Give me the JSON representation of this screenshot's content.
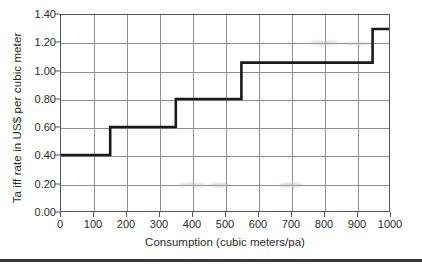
{
  "chart_data": {
    "type": "line",
    "subtype": "step",
    "title": "",
    "xlabel": "Consumption (cubic meters/pa)",
    "ylabel": "Ta iff rate in US$ per cubic meter",
    "xlim": [
      0,
      1000
    ],
    "ylim": [
      0.0,
      1.4
    ],
    "grid": true,
    "legend": null,
    "x_ticks": [
      0,
      100,
      200,
      300,
      400,
      500,
      600,
      700,
      800,
      900,
      1000
    ],
    "x_tick_labels": [
      "0",
      "100",
      "200",
      "300",
      "400",
      "500",
      "600",
      "700",
      "800",
      "900",
      "1000"
    ],
    "y_ticks": [
      0.0,
      0.2,
      0.4,
      0.6,
      0.8,
      1.0,
      1.2,
      1.4
    ],
    "y_tick_labels": [
      "0.00",
      "0.20",
      "0.40",
      "0.60",
      "0.80",
      "1.00",
      "1.20",
      "1.40"
    ],
    "series": [
      {
        "name": "Tariff rate",
        "step_type": "post",
        "color": "#1a1a1a",
        "line_width": 2.6,
        "breakpoints": [
          0,
          150,
          350,
          550,
          950,
          1000
        ],
        "values": [
          0.4,
          0.6,
          0.8,
          1.06,
          1.3
        ],
        "points": [
          {
            "x": 0,
            "y": 0.4
          },
          {
            "x": 150,
            "y": 0.4
          },
          {
            "x": 150,
            "y": 0.6
          },
          {
            "x": 350,
            "y": 0.6
          },
          {
            "x": 350,
            "y": 0.8
          },
          {
            "x": 550,
            "y": 0.8
          },
          {
            "x": 550,
            "y": 1.06
          },
          {
            "x": 950,
            "y": 1.06
          },
          {
            "x": 950,
            "y": 1.3
          },
          {
            "x": 1000,
            "y": 1.3
          }
        ],
        "bands": [
          {
            "from": 0,
            "to": 150,
            "rate": 0.4
          },
          {
            "from": 150,
            "to": 350,
            "rate": 0.6
          },
          {
            "from": 350,
            "to": 550,
            "rate": 0.8
          },
          {
            "from": 550,
            "to": 950,
            "rate": 1.06
          },
          {
            "from": 950,
            "to": 1000,
            "rate": 1.3
          }
        ]
      }
    ]
  },
  "axes": {
    "y_title": "Ta iff rate in US$ per cubic meter",
    "x_title": "Consumption (cubic meters/pa)"
  },
  "colors": {
    "line": "#1a1a1a",
    "grid": "#8e8e8e",
    "frame": "#555555",
    "text": "#2b2b2b",
    "background": "#ffffff",
    "rule": "#3a3a3a"
  }
}
